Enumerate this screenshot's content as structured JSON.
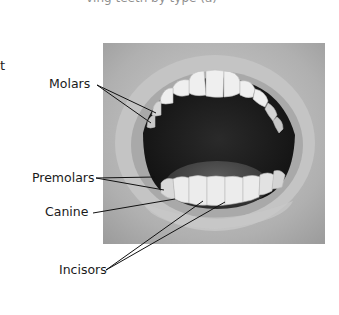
{
  "header": {
    "cut_off_text": "ving teeth by type (a)"
  },
  "fragment": {
    "left_edge_char": "t"
  },
  "figure": {
    "labels": [
      {
        "id": "molars",
        "text": "Molars",
        "pointer_count": 2
      },
      {
        "id": "premolars",
        "text": "Premolars",
        "pointer_count": 2
      },
      {
        "id": "canine",
        "text": "Canine",
        "pointer_count": 1
      },
      {
        "id": "incisors",
        "text": "Incisors",
        "pointer_count": 2
      }
    ],
    "colors": {
      "background": "#ffffff",
      "label_text": "#1a1a1a",
      "leader_line": "#111111",
      "photo_skin": "#b8b8b8",
      "mouth_dark": "#1c1c1c",
      "teeth": "#eeeeee"
    }
  }
}
